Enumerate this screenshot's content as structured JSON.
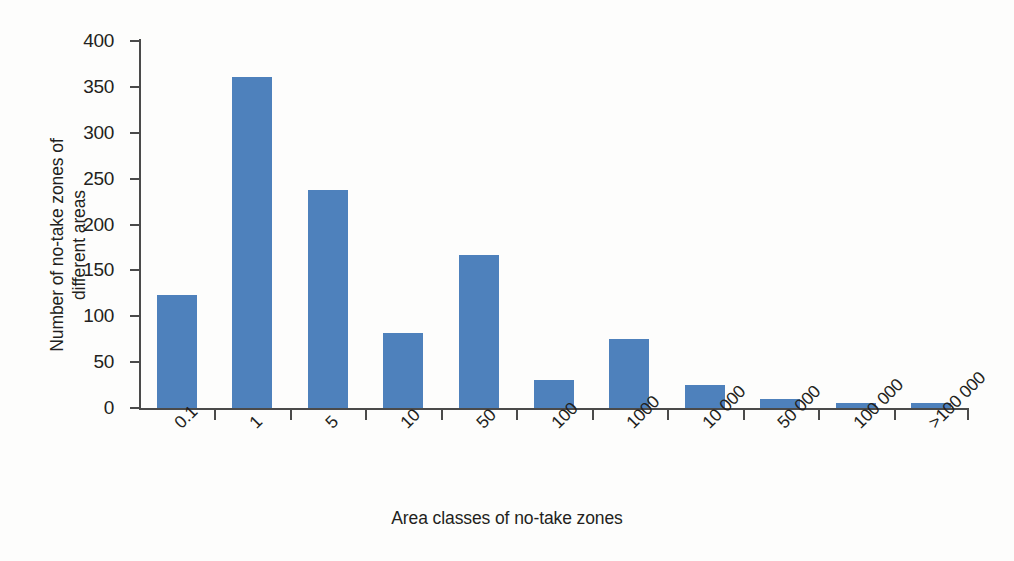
{
  "chart_data": {
    "type": "bar",
    "title": "",
    "xlabel": "Area classes of no-take zones",
    "ylabel": "Number of no-take zones of\ndifferent areas",
    "categories": [
      "0.1",
      "1",
      "5",
      "10",
      "50",
      "100",
      "1000",
      "10 000",
      "50 000",
      "100 000",
      ">100 000"
    ],
    "values": [
      123,
      361,
      238,
      82,
      167,
      31,
      75,
      25,
      10,
      5,
      5
    ],
    "ylim": [
      0,
      400
    ],
    "yticks": [
      0,
      50,
      100,
      150,
      200,
      250,
      300,
      350,
      400
    ],
    "ytick_labels": [
      "0",
      "50",
      "100",
      "150",
      "200",
      "250",
      "300",
      "350",
      "400"
    ],
    "grid": false,
    "legend": false,
    "bar_color": "#4e81bc",
    "axis_color": "#4a4a4a",
    "background": "#fdfdfc",
    "xtick_label_rotation": -45
  },
  "axes": {
    "y_title_line1": "Number of no-take zones of",
    "y_title_line2": "different areas",
    "x_title": "Area classes of no-take zones"
  }
}
